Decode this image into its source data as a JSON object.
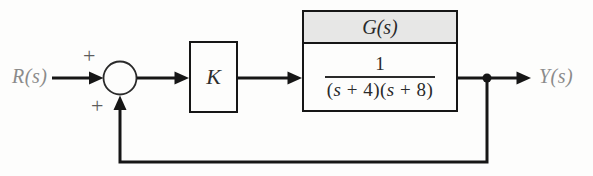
{
  "figure": {
    "input_label": "R(s)",
    "output_label": "Y(s)",
    "summing_junction": {
      "top_sign": "+",
      "bottom_sign": "+"
    },
    "gain_block": {
      "label": "K"
    },
    "plant_block": {
      "title": "G(s)",
      "transfer_function": {
        "numerator": "1",
        "denominator": "(s + 4)(s + 8)",
        "denominator_parts": [
          "(",
          "s",
          " + 4)(",
          "s",
          " + 8)"
        ]
      }
    },
    "colors": {
      "line": "#161616",
      "plant_header_fill": "#e7e7e6",
      "io_label_gray": "#8b8b8b"
    }
  }
}
